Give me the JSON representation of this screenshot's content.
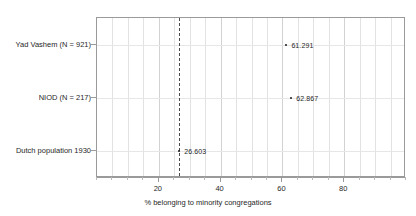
{
  "chart_data": {
    "type": "scatter",
    "title": "",
    "xlabel": "% belonging to minority congregations",
    "ylabel": "",
    "xlim": [
      0,
      100
    ],
    "xticks": [
      20,
      40,
      60,
      80
    ],
    "xticklabels": [
      "20",
      "40",
      "60",
      "80"
    ],
    "grid": true,
    "legend": false,
    "categories": [
      "Yad Vashem (N = 921)",
      "NIOD (N = 217)",
      "Dutch population 1930"
    ],
    "points": [
      {
        "category": "Yad Vashem (N = 921)",
        "value": 61.291,
        "label": "61.291"
      },
      {
        "category": "NIOD (N = 217)",
        "value": 62.867,
        "label": "62.867"
      },
      {
        "category": "Dutch population 1930",
        "value": 26.603,
        "label": "26.603"
      }
    ],
    "reference_line": {
      "value": 26.603,
      "style": "dashed",
      "orientation": "vertical"
    },
    "colors": {
      "point": "#1a1a1a",
      "refline": "#4a4a4a",
      "grid": "#e2e2e2",
      "axis": "#9a9a9a",
      "text": "#1f1f1f",
      "background": "#ffffff"
    }
  }
}
